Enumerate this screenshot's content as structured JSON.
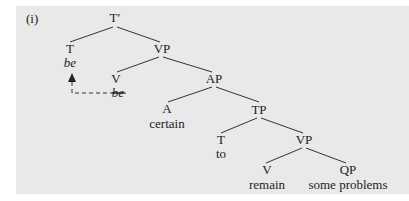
{
  "example_label": "(i)",
  "tree": {
    "root": {
      "label": "T′"
    },
    "t_head": {
      "label": "T",
      "word": "be"
    },
    "vp1": {
      "label": "VP"
    },
    "v_head": {
      "label": "V",
      "word": "be",
      "word_struck": true
    },
    "ap": {
      "label": "AP"
    },
    "a_head": {
      "label": "A",
      "word": "certain"
    },
    "tp": {
      "label": "TP"
    },
    "t2_head": {
      "label": "T",
      "word": "to"
    },
    "vp2": {
      "label": "VP"
    },
    "v2_head": {
      "label": "V",
      "word": "remain"
    },
    "qp": {
      "label": "QP",
      "word": "some problems"
    },
    "movement": {
      "from": "V be",
      "to": "T be",
      "style": "dashed-arrow"
    }
  },
  "colors": {
    "panel_bg": "#e9e9e9",
    "ink": "#222222"
  }
}
